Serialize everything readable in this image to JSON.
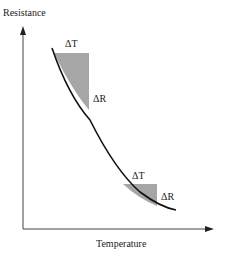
{
  "diagram": {
    "y_axis_label": "Resistance",
    "x_axis_label": "Temperature",
    "annotations": {
      "upper_delta_t": "ΔT",
      "upper_delta_r": "ΔR",
      "lower_delta_t": "ΔT",
      "lower_delta_r": "ΔR"
    },
    "colors": {
      "curve": "#111111",
      "shaded": "#a6a6a6",
      "axis": "#333333"
    }
  }
}
